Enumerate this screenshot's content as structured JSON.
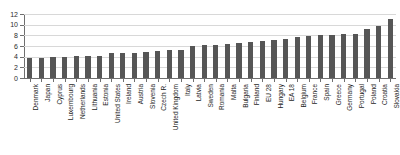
{
  "chart_data": {
    "type": "bar",
    "title": "",
    "subtitle": "",
    "xlabel": "",
    "ylabel": "",
    "ylim": [
      0,
      12
    ],
    "ytick_step": 2,
    "yticks": [
      "0",
      "2",
      "4",
      "6",
      "8",
      "10",
      "12"
    ],
    "grid": true,
    "legend": false,
    "bar_color": "#565656",
    "gridline_color": "#d8d8d8",
    "axis_color": "#6f6f6f",
    "categories": [
      "Denmark",
      "Japan",
      "Cyprus",
      "Luxembourg",
      "Netherlands",
      "Lithuania",
      "Estonia",
      "United States",
      "Ireland",
      "Austria",
      "Slovenia",
      "Czech R.",
      "United Kingdom",
      "Italy",
      "Latvia",
      "Sweden",
      "Romania",
      "Malta",
      "Bulgaria",
      "Finland",
      "EU 28",
      "Hungary",
      "EA 18",
      "Belgium",
      "France",
      "Spain",
      "Greece",
      "Germany",
      "Portugal",
      "Poland",
      "Croatia",
      "Slovakia"
    ],
    "values": [
      3.7,
      3.8,
      3.9,
      4.0,
      4.1,
      4.2,
      4.2,
      4.6,
      4.6,
      4.7,
      4.9,
      5.0,
      5.2,
      5.3,
      6.0,
      6.1,
      6.2,
      6.4,
      6.6,
      6.8,
      7.0,
      7.2,
      7.3,
      7.6,
      7.8,
      8.0,
      8.1,
      8.2,
      8.3,
      9.2,
      9.8,
      11.0
    ]
  }
}
